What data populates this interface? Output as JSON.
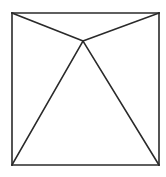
{
  "diagram": {
    "stroke_color": "#2a2a2a",
    "stroke_width": 1.6,
    "background": "#ffffff",
    "square": {
      "x1": 12,
      "y1": 13,
      "x2": 159,
      "y2": 165
    },
    "apex": {
      "x": 83,
      "y": 41
    },
    "segments": [
      {
        "name": "top-edge",
        "x1": 12,
        "y1": 13,
        "x2": 159,
        "y2": 13
      },
      {
        "name": "right-edge",
        "x1": 159,
        "y1": 13,
        "x2": 159,
        "y2": 165
      },
      {
        "name": "bottom-edge",
        "x1": 12,
        "y1": 165,
        "x2": 159,
        "y2": 165
      },
      {
        "name": "left-edge",
        "x1": 12,
        "y1": 13,
        "x2": 12,
        "y2": 165
      },
      {
        "name": "top-left-to-apex",
        "x1": 12,
        "y1": 13,
        "x2": 83,
        "y2": 41
      },
      {
        "name": "top-right-to-apex",
        "x1": 159,
        "y1": 13,
        "x2": 83,
        "y2": 41
      },
      {
        "name": "bottom-left-to-apex",
        "x1": 12,
        "y1": 165,
        "x2": 83,
        "y2": 41
      },
      {
        "name": "bottom-right-to-apex",
        "x1": 159,
        "y1": 165,
        "x2": 83,
        "y2": 41
      }
    ]
  }
}
